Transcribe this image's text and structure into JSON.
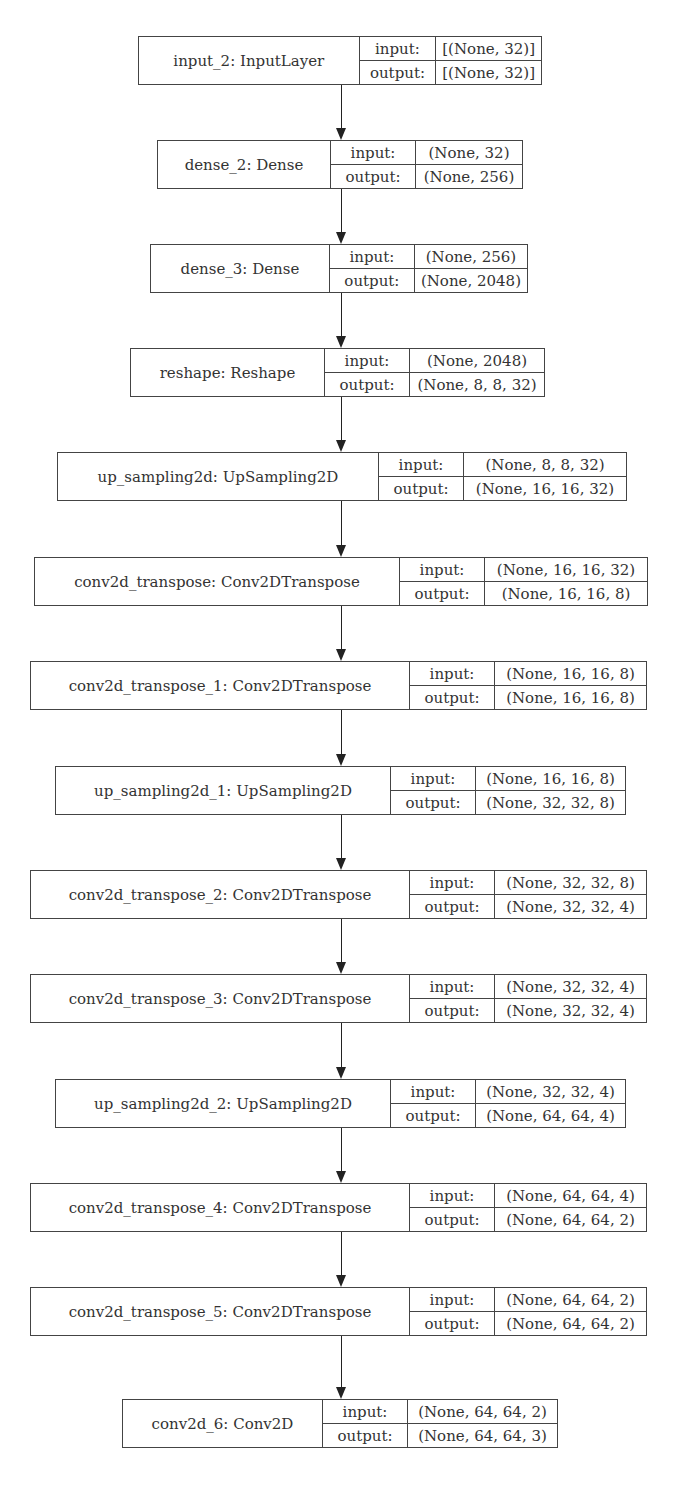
{
  "diagram": {
    "type": "keras-model-plot",
    "nodes": [
      {
        "name": "input_2: InputLayer",
        "input": "[(None, 32)]",
        "output": "[(None, 32)]",
        "x": 138,
        "y": 36,
        "w": 404,
        "nw": 210,
        "lw": 78
      },
      {
        "name": "dense_2: Dense",
        "input": "(None, 32)",
        "output": "(None, 256)",
        "x": 157,
        "y": 140,
        "w": 366,
        "nw": 156,
        "lw": 84
      },
      {
        "name": "dense_3: Dense",
        "input": "(None, 256)",
        "output": "(None, 2048)",
        "x": 150,
        "y": 244,
        "w": 378,
        "nw": 162,
        "lw": 84
      },
      {
        "name": "reshape: Reshape",
        "input": "(None, 2048)",
        "output": "(None, 8, 8, 32)",
        "x": 130,
        "y": 348,
        "w": 415,
        "nw": 177,
        "lw": 84
      },
      {
        "name": "up_sampling2d: UpSampling2D",
        "input": "(None, 8, 8, 32)",
        "output": "(None, 16, 16, 32)",
        "x": 57,
        "y": 452,
        "w": 570,
        "nw": 304,
        "lw": 84
      },
      {
        "name": "conv2d_transpose: Conv2DTranspose",
        "input": "(None, 16, 16, 32)",
        "output": "(None, 16, 16, 8)",
        "x": 34,
        "y": 557,
        "w": 614,
        "nw": 348,
        "lw": 84
      },
      {
        "name": "conv2d_transpose_1: Conv2DTranspose",
        "input": "(None, 16, 16, 8)",
        "output": "(None, 16, 16, 8)",
        "x": 30,
        "y": 661,
        "w": 617,
        "nw": 362,
        "lw": 84
      },
      {
        "name": "up_sampling2d_1: UpSampling2D",
        "input": "(None, 16, 16, 8)",
        "output": "(None, 32, 32, 8)",
        "x": 55,
        "y": 766,
        "w": 571,
        "nw": 318,
        "lw": 84
      },
      {
        "name": "conv2d_transpose_2: Conv2DTranspose",
        "input": "(None, 32, 32, 8)",
        "output": "(None, 32, 32, 4)",
        "x": 30,
        "y": 870,
        "w": 617,
        "nw": 362,
        "lw": 84
      },
      {
        "name": "conv2d_transpose_3: Conv2DTranspose",
        "input": "(None, 32, 32, 4)",
        "output": "(None, 32, 32, 4)",
        "x": 30,
        "y": 974,
        "w": 617,
        "nw": 362,
        "lw": 84
      },
      {
        "name": "up_sampling2d_2: UpSampling2D",
        "input": "(None, 32, 32, 4)",
        "output": "(None, 64, 64, 4)",
        "x": 55,
        "y": 1079,
        "w": 571,
        "nw": 318,
        "lw": 84
      },
      {
        "name": "conv2d_transpose_4: Conv2DTranspose",
        "input": "(None, 64, 64, 4)",
        "output": "(None, 64, 64, 2)",
        "x": 30,
        "y": 1183,
        "w": 617,
        "nw": 362,
        "lw": 84
      },
      {
        "name": "conv2d_transpose_5: Conv2DTranspose",
        "input": "(None, 64, 64, 2)",
        "output": "(None, 64, 64, 2)",
        "x": 30,
        "y": 1287,
        "w": 617,
        "nw": 362,
        "lw": 84
      },
      {
        "name": "conv2d_6: Conv2D",
        "input": "(None, 64, 64, 2)",
        "output": "(None, 64, 64, 3)",
        "x": 122,
        "y": 1399,
        "w": 436,
        "nw": 183,
        "lw": 84
      }
    ],
    "labels": {
      "input": "input:",
      "output": "output:"
    },
    "colors": {
      "border": "#444444",
      "text": "#333333",
      "edge": "#222222"
    },
    "edge_x": 341
  }
}
